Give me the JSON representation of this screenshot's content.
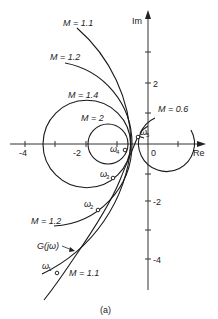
{
  "figure": {
    "caption": "(a)",
    "axes": {
      "x_label": "Re",
      "y_label": "Im",
      "x_ticks": [
        {
          "value": -4,
          "label": "-4"
        },
        {
          "value": -3,
          "label": ""
        },
        {
          "value": -2,
          "label": "-2"
        },
        {
          "value": -1,
          "label": ""
        },
        {
          "value": 0,
          "label": "0"
        },
        {
          "value": 1,
          "label": ""
        }
      ],
      "y_ticks": [
        {
          "value": 3,
          "label": ""
        },
        {
          "value": 2,
          "label": "2"
        },
        {
          "value": 1,
          "label": ""
        },
        {
          "value": -1,
          "label": ""
        },
        {
          "value": -2,
          "label": "-2"
        },
        {
          "value": -3,
          "label": ""
        },
        {
          "value": -4,
          "label": "-4"
        }
      ]
    },
    "m_circles": [
      {
        "label": "M = 1.1",
        "M": 1.1
      },
      {
        "label": "M = 1.2",
        "M": 1.2
      },
      {
        "label": "M = 1.4",
        "M": 1.4
      },
      {
        "label": "M = 2",
        "M": 2
      },
      {
        "label": "M = 0.6",
        "M": 0.6
      }
    ],
    "lower_labels": {
      "m12": "M = 1.2",
      "m11": "M = 1.1"
    },
    "nyquist_curve_label": "G(jω)",
    "frequency_points": [
      {
        "label": "ω",
        "sub": "1"
      },
      {
        "label": "ω",
        "sub": "2"
      },
      {
        "label": "ω",
        "sub": "3"
      },
      {
        "label": "ω",
        "sub": "4"
      },
      {
        "label": "ω",
        "sub": "5"
      }
    ]
  }
}
